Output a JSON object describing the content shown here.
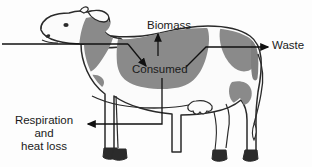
{
  "diagram": {
    "labels": {
      "biomass": "Biomass",
      "consumed": "Consumed",
      "waste": "Waste",
      "respiration_line1": "Respiration and",
      "respiration_line2": "heat loss"
    },
    "flows": [
      {
        "name": "intake",
        "label": "",
        "direction": "right",
        "target": "consumed"
      },
      {
        "name": "biomass",
        "label": "Biomass",
        "direction": "up",
        "source": "consumed"
      },
      {
        "name": "waste",
        "label": "Waste",
        "direction": "right",
        "source": "consumed"
      },
      {
        "name": "respiration",
        "label": "Respiration and heat loss",
        "direction": "left",
        "source": "consumed"
      }
    ],
    "colors": {
      "background": "#fdfdfd",
      "outline": "#2a2a2a",
      "patch_gray": "#8a8a8a",
      "patch_gray_dark": "#6f6f6f",
      "body_white": "#fbfbfb",
      "hoof": "#2b2b2b",
      "text": "#1a1a1a",
      "arrow": "#111111"
    }
  }
}
